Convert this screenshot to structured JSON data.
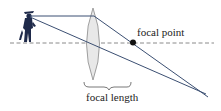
{
  "labels": {
    "focal_point": "focal point",
    "focal_length": "focal length"
  },
  "colors": {
    "ray": "#3b4f72",
    "axis": "#888888",
    "lens_fill": "#e6e6e6",
    "lens_stroke": "#8a8a8a",
    "figure": "#1f2a4a",
    "point": "#111111"
  },
  "icons": {
    "figure": "pirate-figure-icon",
    "lens": "convex-lens-icon"
  }
}
